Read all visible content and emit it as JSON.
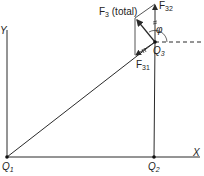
{
  "diagram": {
    "axes": {
      "x_label": "X",
      "y_label": "Y"
    },
    "charges": [
      {
        "name": "Q",
        "sub": "1"
      },
      {
        "name": "Q",
        "sub": "2"
      },
      {
        "name": "Q",
        "sub": "3"
      }
    ],
    "forces": {
      "total": {
        "name": "F",
        "sub": "3",
        "suffix": " (total)"
      },
      "f31": {
        "name": "F",
        "sub": "31"
      },
      "f32": {
        "name": "F",
        "sub": "32"
      }
    },
    "angle_label": "φ",
    "colors": {
      "line": "#2a2a2a",
      "background": "#ffffff"
    }
  }
}
